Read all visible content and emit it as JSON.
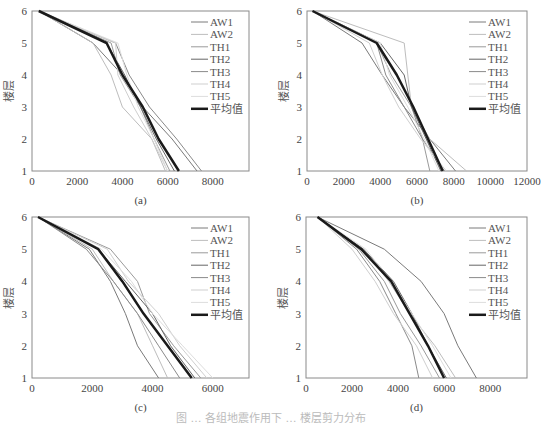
{
  "figure": {
    "caption": "图 … 各组地震作用下 … 楼层剪力分布"
  },
  "legend": {
    "entries": [
      {
        "name": "AW1",
        "color": "#7a7a7a",
        "width": 1
      },
      {
        "name": "AW2",
        "color": "#bdbdbd",
        "width": 1
      },
      {
        "name": "TH1",
        "color": "#9a9a9a",
        "width": 1
      },
      {
        "name": "TH2",
        "color": "#666666",
        "width": 1
      },
      {
        "name": "TH3",
        "color": "#8a8a8a",
        "width": 1
      },
      {
        "name": "TH4",
        "color": "#cfcfcf",
        "width": 1
      },
      {
        "name": "TH5",
        "color": "#dddddd",
        "width": 1
      },
      {
        "name": "平均值",
        "color": "#1a1a1a",
        "width": 2.5
      }
    ]
  },
  "chart_data": [
    {
      "type": "line",
      "panel_label": "(a)",
      "ylabel": "楼层",
      "xlabel": "",
      "y": [
        1,
        2,
        3,
        4,
        5,
        6
      ],
      "xlim": [
        0,
        9600
      ],
      "ylim": [
        1,
        6
      ],
      "xticks": [
        0,
        2000,
        4000,
        6000,
        8000
      ],
      "yticks": [
        1,
        2,
        3,
        4,
        5,
        6
      ],
      "grid": false,
      "legend_position": "upper right",
      "frame": {
        "x0": 32,
        "y0": 11,
        "x1": 249,
        "y1": 171
      },
      "series": [
        {
          "name": "AW1",
          "values": [
            7300,
            6200,
            4900,
            4000,
            2700,
            300
          ]
        },
        {
          "name": "AW2",
          "values": [
            5900,
            5300,
            4000,
            3500,
            2700,
            300
          ]
        },
        {
          "name": "TH1",
          "values": [
            6100,
            5400,
            4800,
            3900,
            3500,
            300
          ]
        },
        {
          "name": "TH2",
          "values": [
            6300,
            5500,
            4800,
            4100,
            3300,
            300
          ]
        },
        {
          "name": "TH3",
          "values": [
            7500,
            6400,
            5200,
            4300,
            3700,
            300
          ]
        },
        {
          "name": "TH4",
          "values": [
            6000,
            5300,
            4500,
            3800,
            3700,
            300
          ]
        },
        {
          "name": "TH5",
          "values": [
            6000,
            5400,
            4700,
            4200,
            3800,
            300
          ]
        },
        {
          "name": "平均值",
          "values": [
            6500,
            5600,
            4900,
            4000,
            3300,
            300
          ]
        }
      ]
    },
    {
      "type": "line",
      "panel_label": "(b)",
      "ylabel": "楼层",
      "xlabel": "",
      "y": [
        1,
        2,
        3,
        4,
        5,
        6
      ],
      "xlim": [
        0,
        12000
      ],
      "ylim": [
        1,
        6
      ],
      "xticks": [
        0,
        2000,
        4000,
        6000,
        8000,
        10000,
        12000
      ],
      "yticks": [
        1,
        2,
        3,
        4,
        5,
        6
      ],
      "grid": false,
      "legend_position": "upper right",
      "frame": {
        "x0": 307,
        "y0": 11,
        "x1": 527,
        "y1": 171
      },
      "series": [
        {
          "name": "AW1",
          "values": [
            8100,
            6700,
            5300,
            4100,
            3000,
            300
          ]
        },
        {
          "name": "AW2",
          "values": [
            8700,
            6700,
            5700,
            5500,
            5300,
            300
          ]
        },
        {
          "name": "TH1",
          "values": [
            6700,
            6300,
            5700,
            4600,
            3800,
            300
          ]
        },
        {
          "name": "TH2",
          "values": [
            7300,
            6500,
            5700,
            5300,
            4000,
            300
          ]
        },
        {
          "name": "TH3",
          "values": [
            7500,
            6300,
            5300,
            4300,
            3800,
            300
          ]
        },
        {
          "name": "TH4",
          "values": [
            7600,
            6200,
            5000,
            4100,
            3400,
            300
          ]
        },
        {
          "name": "TH5",
          "values": [
            7200,
            6400,
            5500,
            4500,
            4000,
            300
          ]
        },
        {
          "name": "平均值",
          "values": [
            7400,
            6600,
            5800,
            4900,
            3800,
            300
          ]
        }
      ]
    },
    {
      "type": "line",
      "panel_label": "(c)",
      "ylabel": "楼层",
      "xlabel": "",
      "y": [
        1,
        2,
        3,
        4,
        5,
        6
      ],
      "xlim": [
        0,
        7200
      ],
      "ylim": [
        1,
        6
      ],
      "xticks": [
        0,
        2000,
        4000,
        6000
      ],
      "yticks": [
        1,
        2,
        3,
        4,
        5,
        6
      ],
      "grid": false,
      "legend_position": "upper right",
      "frame": {
        "x0": 32,
        "y0": 217,
        "x1": 249,
        "y1": 378
      },
      "series": [
        {
          "name": "AW1",
          "values": [
            4200,
            3500,
            3100,
            2600,
            1900,
            200
          ]
        },
        {
          "name": "AW2",
          "values": [
            4500,
            4000,
            3500,
            2700,
            2000,
            200
          ]
        },
        {
          "name": "TH1",
          "values": [
            5600,
            4700,
            3900,
            3500,
            2600,
            200
          ]
        },
        {
          "name": "TH2",
          "values": [
            5400,
            4600,
            4000,
            3100,
            2200,
            200
          ]
        },
        {
          "name": "TH3",
          "values": [
            4900,
            4200,
            3500,
            2700,
            1800,
            200
          ]
        },
        {
          "name": "TH4",
          "values": [
            5800,
            4900,
            4200,
            3200,
            2500,
            200
          ]
        },
        {
          "name": "TH5",
          "values": [
            6000,
            5000,
            4000,
            3300,
            2300,
            200
          ]
        },
        {
          "name": "平均值",
          "values": [
            5300,
            4500,
            3700,
            3000,
            2200,
            200
          ]
        }
      ]
    },
    {
      "type": "line",
      "panel_label": "(d)",
      "ylabel": "楼层",
      "xlabel": "",
      "y": [
        1,
        2,
        3,
        4,
        5,
        6
      ],
      "xlim": [
        0,
        9600
      ],
      "ylim": [
        1,
        6
      ],
      "xticks": [
        0,
        2000,
        4000,
        6000,
        8000
      ],
      "yticks": [
        1,
        2,
        3,
        4,
        5,
        6
      ],
      "grid": false,
      "legend_position": "upper right",
      "frame": {
        "x0": 306,
        "y0": 217,
        "x1": 527,
        "y1": 378
      },
      "series": [
        {
          "name": "AW1",
          "values": [
            7400,
            6600,
            6000,
            5000,
            3400,
            500
          ]
        },
        {
          "name": "AW2",
          "values": [
            6500,
            5600,
            4500,
            3600,
            2500,
            500
          ]
        },
        {
          "name": "TH1",
          "values": [
            5800,
            5000,
            4100,
            3400,
            2300,
            500
          ]
        },
        {
          "name": "TH2",
          "values": [
            6100,
            5300,
            4600,
            3800,
            2500,
            500
          ]
        },
        {
          "name": "TH3",
          "values": [
            4900,
            4600,
            3900,
            3200,
            2200,
            500
          ]
        },
        {
          "name": "TH4",
          "values": [
            5500,
            4800,
            3800,
            3000,
            2000,
            500
          ]
        },
        {
          "name": "TH5",
          "values": [
            6300,
            5500,
            4600,
            3700,
            2600,
            500
          ]
        },
        {
          "name": "平均值",
          "values": [
            6000,
            5300,
            4500,
            3700,
            2400,
            500
          ]
        }
      ]
    }
  ]
}
